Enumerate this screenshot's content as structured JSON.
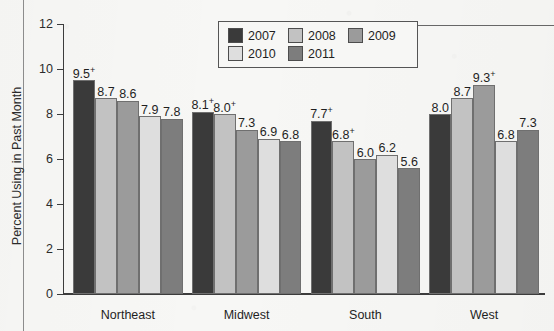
{
  "chart_data": {
    "type": "bar",
    "title": "",
    "xlabel": "",
    "ylabel": "Percent Using in Past Month",
    "categories": [
      "Northeast",
      "Midwest",
      "South",
      "West"
    ],
    "ylim": [
      0,
      12
    ],
    "yticks": [
      "0",
      "2",
      "4",
      "6",
      "8",
      "10",
      "12"
    ],
    "grid": false,
    "legend_position": "top-center",
    "series": [
      {
        "name": "2007",
        "color": "#3a3a3a",
        "values": [
          9.5,
          8.1,
          7.7,
          8.0
        ],
        "labels": [
          "9.5",
          "8.1",
          "7.7",
          "8.0"
        ],
        "marks": [
          "+",
          "+",
          "+",
          ""
        ]
      },
      {
        "name": "2008",
        "color": "#c2c2c2",
        "values": [
          8.7,
          8.0,
          6.8,
          8.7
        ],
        "labels": [
          "8.7",
          "8.0",
          "6.8",
          "8.7"
        ],
        "marks": [
          "",
          "+",
          "+",
          ""
        ]
      },
      {
        "name": "2009",
        "color": "#9b9b9b",
        "values": [
          8.6,
          7.3,
          6.0,
          9.3
        ],
        "labels": [
          "8.6",
          "7.3",
          "6.0",
          "9.3"
        ],
        "marks": [
          "",
          "",
          "",
          "+"
        ]
      },
      {
        "name": "2010",
        "color": "#dedede",
        "values": [
          7.9,
          6.9,
          6.2,
          6.8
        ],
        "labels": [
          "7.9",
          "6.9",
          "6.2",
          "6.8"
        ],
        "marks": [
          "",
          "",
          "",
          ""
        ]
      },
      {
        "name": "2011",
        "color": "#7d7d7d",
        "values": [
          7.8,
          6.8,
          5.6,
          7.3
        ],
        "labels": [
          "7.8",
          "6.8",
          "5.6",
          "7.3"
        ],
        "marks": [
          "",
          "",
          "",
          ""
        ]
      }
    ]
  },
  "legend": {
    "items": [
      {
        "label": "2007",
        "color": "#3a3a3a"
      },
      {
        "label": "2008",
        "color": "#c2c2c2"
      },
      {
        "label": "2009",
        "color": "#9b9b9b"
      },
      {
        "label": "2010",
        "color": "#dedede"
      },
      {
        "label": "2011",
        "color": "#7d7d7d"
      }
    ]
  },
  "axis": {
    "y_title": "Percent Using in Past Month"
  }
}
